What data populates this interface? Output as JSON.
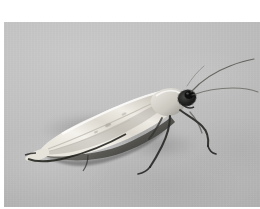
{
  "page": {
    "type": "photograph",
    "background_color": "#ffffff",
    "width": 260,
    "height": 209
  },
  "photo": {
    "name": "moth-photograph",
    "subject": "moth",
    "caption": "",
    "color_mode": "grayscale",
    "plate": {
      "left": 4,
      "top": 22,
      "width": 256,
      "height": 185
    },
    "palette": {
      "background_gray": "#bdbdbd",
      "background_light": "#c9c9c9",
      "background_dark": "#b3b3b3",
      "wing_highlight": "#f2f0ea",
      "wing_midtone": "#dedbd2",
      "wing_shadow": "#9a978f",
      "wing_edge_dark": "#2a2a28",
      "head_dark": "#1e1e1e",
      "leg_dark": "#2b2b2b",
      "antenna_gray": "#5a5a58",
      "page_white": "#ffffff"
    },
    "subject_parts": [
      {
        "name": "forewing",
        "description": "pale cream elongate forewing angled down to the left"
      },
      {
        "name": "wing-tip",
        "description": "pointed wing apex at lower left with dark fringe"
      },
      {
        "name": "thorax",
        "description": "pale thorax behind the head"
      },
      {
        "name": "head",
        "description": "dark head with prominent dark compound eye"
      },
      {
        "name": "antenna-upper",
        "description": "long slender antenna curving up and to the right"
      },
      {
        "name": "antenna-lower",
        "description": "second antenna sweeping right, nearly horizontal"
      },
      {
        "name": "foreleg",
        "description": "dark slender foreleg angled down and forward"
      },
      {
        "name": "midleg",
        "description": "dark slender mid leg angled down and back"
      },
      {
        "name": "hindleg",
        "description": "dark slender hind leg reaching down left"
      },
      {
        "name": "cast-shadow",
        "description": "soft gray shadow cast under the body on the substrate"
      }
    ]
  }
}
